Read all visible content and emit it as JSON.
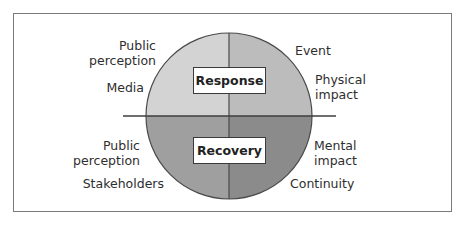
{
  "diagram": {
    "type": "quadrant-circle",
    "phases": {
      "top": {
        "label": "Response"
      },
      "bottom": {
        "label": "Recovery"
      }
    },
    "labels": {
      "top_left": [
        "Public perception",
        "Media"
      ],
      "top_right": [
        "Event",
        "Physical impact"
      ],
      "bottom_left": [
        "Public perception",
        "Stakeholders"
      ],
      "bottom_right": [
        "Mental impact",
        "Continuity"
      ]
    },
    "text": {
      "tl_public_line1": "Public",
      "tl_public_line2": "perception",
      "tl_media": "Media",
      "tr_event": "Event",
      "tr_physical_line1": "Physical",
      "tr_physical_line2": "impact",
      "bl_public_line1": "Public",
      "bl_public_line2": "perception",
      "bl_stakeholders": "Stakeholders",
      "br_mental_line1": "Mental",
      "br_mental_line2": "impact",
      "br_continuity": "Continuity"
    },
    "colors": {
      "quadrant_top_left": "#d3d3d3",
      "quadrant_top_right": "#bcbcbc",
      "quadrant_bottom_left": "#9f9f9f",
      "quadrant_bottom_right": "#8b8b8b",
      "outline": "#4a4a4a",
      "frame": "#7a7a7a"
    }
  }
}
